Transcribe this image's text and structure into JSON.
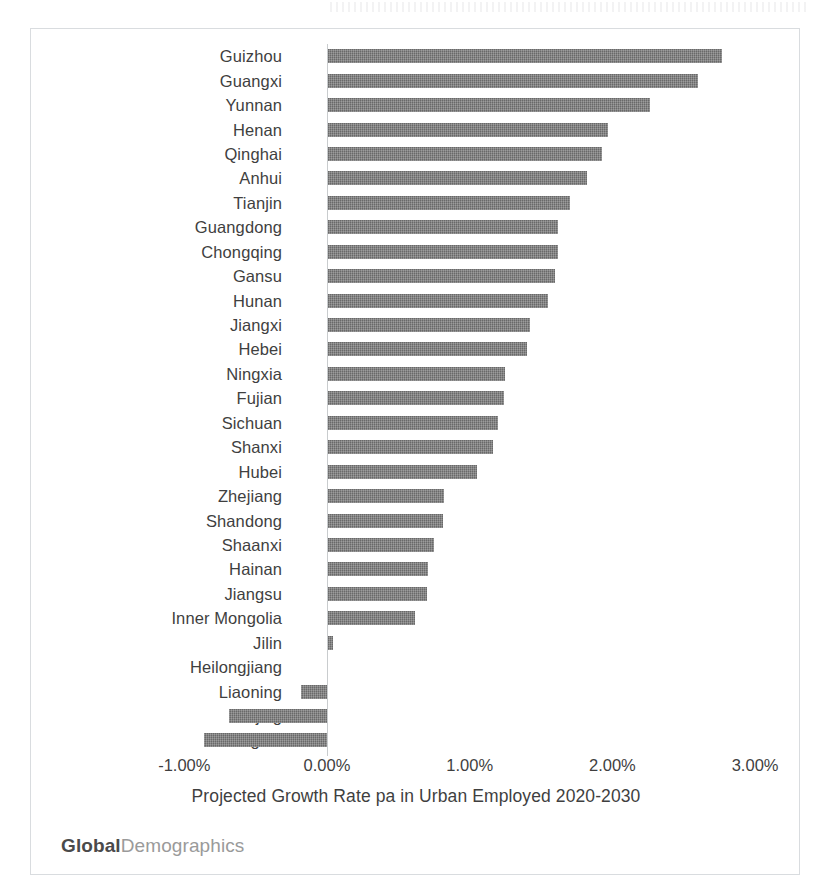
{
  "chart_data": {
    "type": "bar",
    "orientation": "horizontal",
    "title": "",
    "xlabel": "Projected Growth Rate pa in Urban Employed 2020-2030",
    "ylabel": "",
    "xlim": [
      -1.0,
      3.0
    ],
    "xticks": [
      "-1.00%",
      "0.00%",
      "1.00%",
      "2.00%",
      "3.00%"
    ],
    "xtick_values": [
      -1.0,
      0.0,
      1.0,
      2.0,
      3.0
    ],
    "grid": false,
    "legend": false,
    "units": "percent",
    "bar_color": "#767676",
    "categories": [
      "Guizhou",
      "Guangxi",
      "Yunnan",
      "Henan",
      "Qinghai",
      "Anhui",
      "Tianjin",
      "Guangdong",
      "Chongqing",
      "Gansu",
      "Hunan",
      "Jiangxi",
      "Hebei",
      "Ningxia",
      "Fujian",
      "Sichuan",
      "Shanxi",
      "Hubei",
      "Zhejiang",
      "Shandong",
      "Shaanxi",
      "Hainan",
      "Jiangsu",
      "Inner Mongolia",
      "Jilin",
      "Heilongjiang",
      "Liaoning",
      "Beijing",
      "Shanghai"
    ],
    "values": [
      2.77,
      2.6,
      2.26,
      1.97,
      1.93,
      1.82,
      1.7,
      1.62,
      1.62,
      1.6,
      1.55,
      1.42,
      1.4,
      1.25,
      1.24,
      1.2,
      1.16,
      1.05,
      0.82,
      0.81,
      0.75,
      0.71,
      0.7,
      0.62,
      0.04,
      0.0,
      -0.18,
      -0.69,
      -0.86
    ]
  },
  "footer": {
    "brand_strong": "Global",
    "brand_light": "Demographics"
  }
}
